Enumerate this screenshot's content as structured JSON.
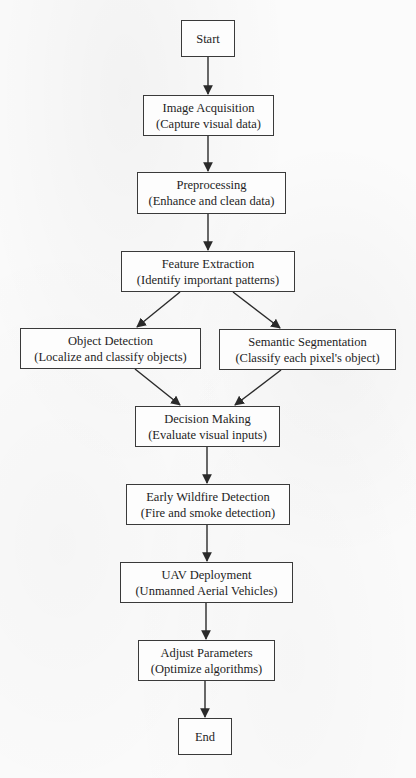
{
  "flowchart": {
    "colors": {
      "background": "#fbfbfb",
      "node_border": "#3a3a3a",
      "node_fill": "#fdfdfd",
      "text": "#1e1e1e",
      "edge": "#2a2a2a"
    },
    "nodes": [
      {
        "id": "start",
        "title": "Start",
        "subtitle": ""
      },
      {
        "id": "image-acquisition",
        "title": "Image Acquisition",
        "subtitle": "(Capture visual data)"
      },
      {
        "id": "preprocessing",
        "title": "Preprocessing",
        "subtitle": "(Enhance and clean data)"
      },
      {
        "id": "feature-extraction",
        "title": "Feature Extraction",
        "subtitle": "(Identify important patterns)"
      },
      {
        "id": "object-detection",
        "title": "Object Detection",
        "subtitle": "(Localize and classify objects)"
      },
      {
        "id": "semantic-segmentation",
        "title": "Semantic Segmentation",
        "subtitle": "(Classify each pixel's object)"
      },
      {
        "id": "decision-making",
        "title": "Decision Making",
        "subtitle": "(Evaluate visual inputs)"
      },
      {
        "id": "early-wildfire-detection",
        "title": "Early Wildfire Detection",
        "subtitle": "(Fire and smoke detection)"
      },
      {
        "id": "uav-deployment",
        "title": "UAV Deployment",
        "subtitle": "(Unmanned Aerial Vehicles)"
      },
      {
        "id": "adjust-parameters",
        "title": "Adjust Parameters",
        "subtitle": "(Optimize algorithms)"
      },
      {
        "id": "end",
        "title": "End",
        "subtitle": ""
      }
    ],
    "edges": [
      {
        "from": "start",
        "to": "image-acquisition"
      },
      {
        "from": "image-acquisition",
        "to": "preprocessing"
      },
      {
        "from": "preprocessing",
        "to": "feature-extraction"
      },
      {
        "from": "feature-extraction",
        "to": "object-detection"
      },
      {
        "from": "feature-extraction",
        "to": "semantic-segmentation"
      },
      {
        "from": "object-detection",
        "to": "decision-making"
      },
      {
        "from": "semantic-segmentation",
        "to": "decision-making"
      },
      {
        "from": "decision-making",
        "to": "early-wildfire-detection"
      },
      {
        "from": "early-wildfire-detection",
        "to": "uav-deployment"
      },
      {
        "from": "uav-deployment",
        "to": "adjust-parameters"
      },
      {
        "from": "adjust-parameters",
        "to": "end"
      }
    ]
  }
}
